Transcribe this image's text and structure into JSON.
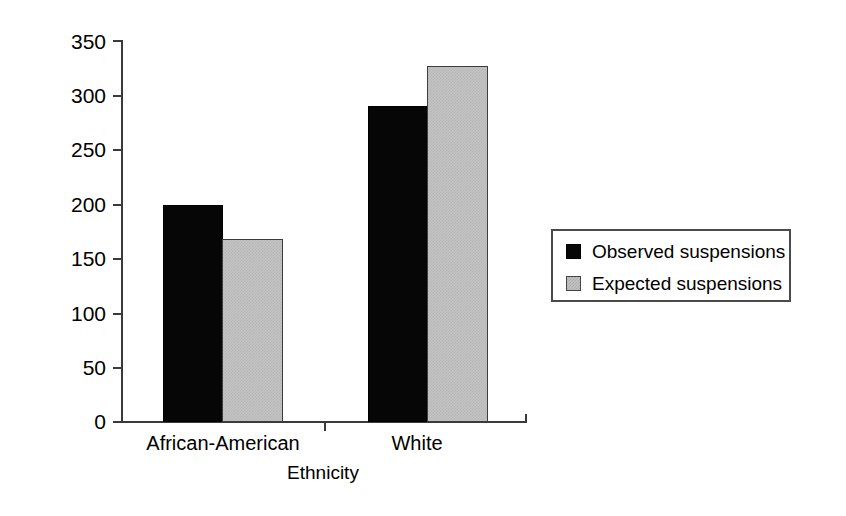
{
  "chart_data": {
    "type": "bar",
    "title": "",
    "xlabel": "Ethnicity",
    "ylabel": "Number of Suspensions",
    "categories": [
      "African-American",
      "White"
    ],
    "series": [
      {
        "name": "Observed suspensions",
        "values": [
          199,
          290
        ],
        "color": "#000000"
      },
      {
        "name": "Expected suspensions",
        "values": [
          168,
          327
        ],
        "color": "#c3c3c3"
      }
    ],
    "ylim": [
      0,
      350
    ],
    "yticks": [
      0,
      50,
      100,
      150,
      200,
      250,
      300,
      350
    ],
    "ytick_labels": [
      "0",
      "50",
      "100",
      "150",
      "200",
      "250",
      "300",
      "350"
    ],
    "grid": false,
    "legend_position": "right"
  },
  "legend": {
    "items": [
      {
        "label": "Observed suspensions",
        "swatch": "black-square-icon"
      },
      {
        "label": "Expected suspensions",
        "swatch": "gray-square-icon"
      }
    ]
  }
}
